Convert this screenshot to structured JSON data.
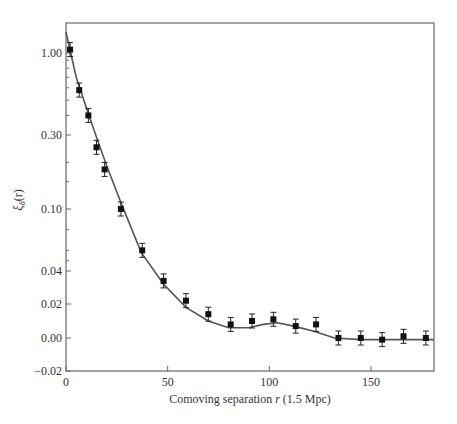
{
  "chart_data": {
    "type": "scatter",
    "title": "",
    "xlabel": "Comoving separation r (1.5 Mpc)",
    "xlabel_parts": {
      "pre": "Comoving separation ",
      "var": "r",
      "post": " (1.5 Mpc)"
    },
    "ylabel": "ξδ(r)",
    "ylabel_parts": {
      "sym": "ξ",
      "sub": "δ",
      "post": "(r)"
    },
    "xlim": [
      0,
      181
    ],
    "x_ticks": [
      0,
      50,
      100,
      150
    ],
    "x_tick_labels": [
      "0",
      "50",
      "100",
      "150"
    ],
    "y_ticks": [
      1.0,
      0.3,
      0.1,
      0.04,
      0.02,
      0.0,
      -0.02
    ],
    "y_tick_labels": [
      "1.00",
      "0.30",
      "0.10",
      "0.04",
      "0.02",
      "0.00",
      "−0.02"
    ],
    "y_scale": "nonlinear (stretched, log-like at top, linear near zero)",
    "grid": false,
    "legend": null,
    "series": [
      {
        "name": "measurements",
        "style": "black squares with error bars",
        "x": [
          2,
          6.5,
          11,
          15,
          19,
          27,
          37.5,
          48,
          59,
          70,
          81,
          91.5,
          102,
          113,
          123,
          134,
          145,
          155.5,
          166,
          177
        ],
        "y": [
          1.05,
          0.58,
          0.4,
          0.25,
          0.18,
          0.1,
          0.06,
          0.034,
          0.022,
          0.014,
          0.008,
          0.01,
          0.011,
          0.007,
          0.008,
          0.0,
          0.0,
          -0.001,
          0.001,
          0.0
        ]
      },
      {
        "name": "model curve",
        "style": "solid grey line",
        "x": [
          0,
          5,
          10,
          15,
          20,
          27,
          37,
          48,
          59,
          70,
          80,
          90,
          97,
          104,
          112,
          122,
          132,
          145,
          160,
          181
        ],
        "y": [
          1.35,
          0.7,
          0.45,
          0.29,
          0.19,
          0.11,
          0.058,
          0.032,
          0.018,
          0.01,
          0.006,
          0.006,
          0.008,
          0.009,
          0.007,
          0.004,
          0.0,
          -0.001,
          -0.001,
          -0.001
        ]
      }
    ],
    "colors": {
      "points": "#111111",
      "curve": "#555555",
      "axis": "#444444"
    }
  }
}
